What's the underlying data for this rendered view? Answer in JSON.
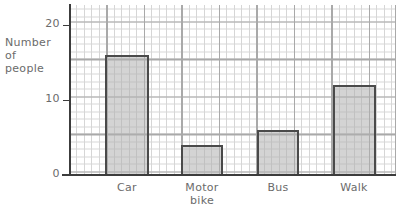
{
  "chart_data": {
    "type": "bar",
    "title": "",
    "subtitle": "",
    "xlabel": "",
    "ylabel": "Number of people",
    "ylabel_lines": [
      "Number",
      "of",
      "people"
    ],
    "categories": [
      "Car",
      "Motor bike",
      "Bus",
      "Walk"
    ],
    "category_lines": [
      [
        "Car"
      ],
      [
        "Motor",
        "bike"
      ],
      [
        "Bus"
      ],
      [
        "Walk"
      ]
    ],
    "values": [
      16,
      4,
      6,
      12
    ],
    "ylim": [
      0,
      22
    ],
    "ytick_labels": [
      "0",
      "10",
      "20"
    ],
    "ytick_values": [
      0,
      10,
      20
    ],
    "grid": "graph-paper-minor-1-major-5",
    "legend": "none",
    "bar_fill_color": "#b0b0b0",
    "bar_edge_color": "#4a4a4a",
    "axis_color": "#3c3c3c",
    "grid_major_color": "#a9a9a9",
    "grid_minor_color": "#d6d6d6",
    "text_color": "#6b6b6b"
  }
}
